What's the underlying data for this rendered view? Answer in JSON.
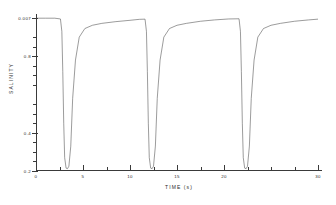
{
  "chart_data": {
    "type": "line",
    "title": "",
    "xlabel": "TIME (s)",
    "ylabel": "SALINITY",
    "xlim": [
      0,
      30
    ],
    "ylim": [
      0.2,
      1.0
    ],
    "grid": false,
    "legend": null,
    "x_ticks_labeled": [
      0,
      5,
      10,
      15,
      20,
      30
    ],
    "x_tick_labels": [
      "0",
      "5",
      "10",
      "15",
      "20",
      "30"
    ],
    "x_minor_ticks": [
      2.5,
      7.5,
      12.5,
      17.5,
      22.5,
      25,
      27.5
    ],
    "y_ticks_labeled": [
      1.0,
      0.4,
      0.8,
      0.2
    ],
    "y_tick_labels": [
      "0.007",
      "0.4",
      "0.8",
      "0.2"
    ],
    "y_minor_ticks": [
      0.9,
      0.85,
      0.75,
      0.7,
      0.65,
      0.55,
      0.5,
      0.45,
      0.35,
      0.3,
      0.25
    ],
    "series": [
      {
        "name": "salinity",
        "description": "Periodic salinity trace showing three sharp downward spikes from a high plateau with rapid exponential recovery",
        "x": [
          0.0,
          1.0,
          2.0,
          2.6,
          2.75,
          2.85,
          2.95,
          3.05,
          3.2,
          3.35,
          3.5,
          3.7,
          3.9,
          4.2,
          4.6,
          5.2,
          6.0,
          7.0,
          8.5,
          10.0,
          11.0,
          11.6,
          11.75,
          11.85,
          11.95,
          12.05,
          12.2,
          12.35,
          12.5,
          12.7,
          12.9,
          13.2,
          13.6,
          14.2,
          15.0,
          16.0,
          17.5,
          19.0,
          20.5,
          21.6,
          21.75,
          21.85,
          21.95,
          22.05,
          22.2,
          22.35,
          22.5,
          22.7,
          22.9,
          23.2,
          23.6,
          24.2,
          25.0,
          26.0,
          27.5,
          29.0,
          30.0
        ],
        "y": [
          0.999,
          0.999,
          0.999,
          0.995,
          0.93,
          0.72,
          0.45,
          0.27,
          0.215,
          0.212,
          0.225,
          0.33,
          0.58,
          0.78,
          0.9,
          0.945,
          0.962,
          0.972,
          0.981,
          0.988,
          0.993,
          0.994,
          0.93,
          0.72,
          0.45,
          0.27,
          0.215,
          0.212,
          0.225,
          0.33,
          0.58,
          0.78,
          0.9,
          0.945,
          0.962,
          0.972,
          0.983,
          0.99,
          0.995,
          0.996,
          0.93,
          0.72,
          0.45,
          0.27,
          0.215,
          0.212,
          0.225,
          0.33,
          0.58,
          0.78,
          0.9,
          0.945,
          0.962,
          0.972,
          0.983,
          0.99,
          0.994
        ]
      }
    ]
  },
  "figure": {
    "background_color": "#ffffff",
    "line_color": "#4a4a4a",
    "axis_color": "#3a3a3a"
  }
}
